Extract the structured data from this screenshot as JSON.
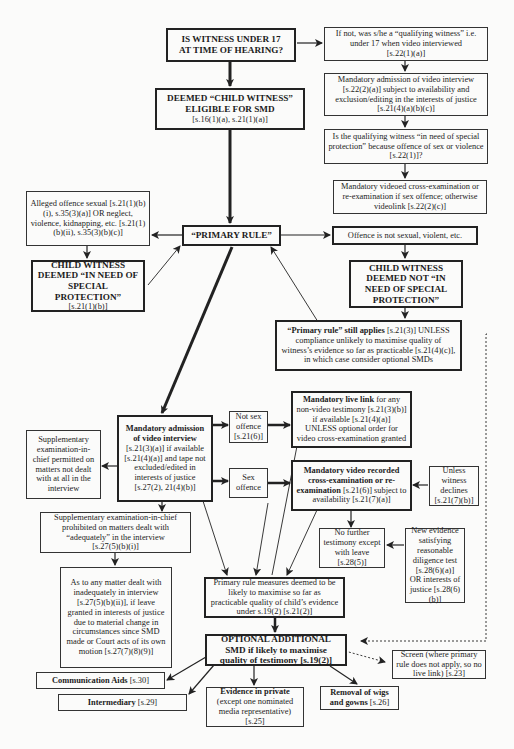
{
  "nodes": {
    "under17": {
      "line1": "IS WITNESS UNDER 17",
      "line2": "AT TIME OF HEARING?"
    },
    "qualifying": {
      "text": "If not, was s/he a “qualifying witness” i.e. under 17 when video interviewed",
      "ref": "[s.22(1)(a)]"
    },
    "mandatory_video_q": {
      "text": "Mandatory admission of video interview [s.22(2)(a)] subject to availability and exclusion/editing in the interests of justice [s.21(4)(a)(b)(c)]"
    },
    "special_protection_q": {
      "text": "Is the qualifying witness “in need of special protection” because offence of sex or violence [s.22(1)]?"
    },
    "videoed_cross": {
      "text": "Mandatory videoed cross-examination or re-examination if sex offence; otherwise videolink [s.22(2)(c)]"
    },
    "deemed_child": {
      "line1": "DEEMED “CHILD WITNESS”",
      "line2": "ELIGIBLE FOR SMD",
      "ref": "[s.16(1)(a), s.21(1)(a)]"
    },
    "alleged_offence": {
      "text": "Alleged offence sexual [s.21(1)(b)(i), s.35(3)(a)] OR neglect, violence, kidnapping, etc. [s.21(1)(b)(ii), s.35(3)(b)(c)]"
    },
    "primary_rule": {
      "text": "“PRIMARY RULE”"
    },
    "not_sexual": {
      "text": "Offence is not sexual, violent, etc."
    },
    "in_need": {
      "title": "CHILD WITNESS DEEMED “IN NEED OF SPECIAL PROTECTION”",
      "ref": "[s.21(1)(b)]"
    },
    "not_in_need": {
      "title": "CHILD WITNESS DEEMED NOT “IN NEED OF SPECIAL PROTECTION”"
    },
    "still_applies": {
      "bold": "“Primary rule” still applies",
      "text": " [s.21(3)] UNLESS compliance unlikely to maximise quality of witness’s evidence so far as practicable [s.21(4)(c)], in which case consider optional SMDs"
    },
    "mandatory_admission": {
      "bold": "Mandatory admission of video interview",
      "text": " [s.21(3)(a)] if available [s.21(4)(a)] and tape not excluded/edited in interests of justice [s.27(2), 21(4)(b)]"
    },
    "supp_permitted": {
      "text": "Supplementary examination-in-chief permitted on matters not dealt with at all in the interview"
    },
    "not_sex_offence": {
      "text": "Not sex offence",
      "ref": "[s.21(6)]"
    },
    "sex_offence": {
      "text": "Sex offence"
    },
    "live_link": {
      "bold": "Mandatory live link",
      "text": " for any non-video testimony [s.21(3)(b)] if available [s.21(4)(a)] UNLESS optional order for video cross-examination granted"
    },
    "video_cross": {
      "bold": "Mandatory video recorded cross-examination or re-examination",
      "text": " [s.21(6)] subject to availability [s.21(7)(a)]"
    },
    "unless_declines": {
      "text": "Unless witness declines",
      "ref": "[s.21(7)(b)]"
    },
    "supp_prohibited": {
      "text": "Supplementary examination-in-chief prohibited on matters dealt with “adequately” in the interview",
      "ref": "[s.27(5)(b)(i)]"
    },
    "no_further": {
      "text": "No further testimony except with leave [s.28(5)]"
    },
    "new_evidence": {
      "text": "New evidence satisfying reasonable diligence test [s.28(6)(a)] OR interests of justice [s.28(6)(b)]"
    },
    "inadequate": {
      "text": "As to any matter dealt with inadequately in interview [s.27(5)(b)(ii)], if leave granted in interests of justice due to material change in circumstances since SMD made or Court acts of its own motion [s.27(7)(8)(9)]"
    },
    "measures_deemed": {
      "text": "Primary rule measures deemed to be likely to maximise so far as practicable quality of child’s evidence under s.19(2) [s.21(2)]"
    },
    "optional_smd": {
      "line1": "OPTIONAL ADDITIONAL",
      "line2": "SMD if likely to maximise",
      "line3": "quality of testimony [s.19(2)]"
    },
    "screen": {
      "text": "Screen (where primary rule does not apply, so no live link) [s.23]"
    },
    "comm_aids": {
      "bold": "Communication Aids",
      "ref": " [s.30]"
    },
    "intermediary": {
      "bold": "Intermediary",
      "ref": " [s.29]"
    },
    "private": {
      "bold": "Evidence in private",
      "text": "(except one nominated media representative)",
      "ref": "[s.25]"
    },
    "wigs": {
      "bold": "Removal of wigs and gowns",
      "ref": " [s.26]"
    }
  },
  "colors": {
    "ink": "#222222",
    "paper": "#fbfbfa"
  }
}
